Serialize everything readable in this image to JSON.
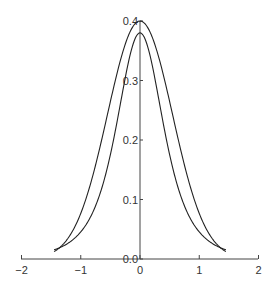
{
  "chart_data": {
    "type": "line",
    "title": "",
    "xlabel": "",
    "ylabel": "",
    "xlim": [
      -2,
      2
    ],
    "ylim": [
      0,
      0.4
    ],
    "grid": false,
    "legend": null,
    "x_ticks": [
      "-2",
      "-1",
      "0",
      "1",
      "2"
    ],
    "y_ticks": [
      "0.0",
      "0.1",
      "0.2",
      "0.3",
      "0.4"
    ],
    "x": [
      -1.45,
      -1.2,
      -1.0,
      -0.8,
      -0.6,
      -0.4,
      -0.2,
      0.0,
      0.2,
      0.4,
      0.6,
      0.8,
      1.0,
      1.2,
      1.45
    ],
    "series": [
      {
        "name": "curve-a (narrow peak)",
        "values": [
          0.012,
          0.037,
          0.076,
          0.139,
          0.219,
          0.304,
          0.374,
          0.4,
          0.374,
          0.304,
          0.219,
          0.139,
          0.076,
          0.037,
          0.012
        ]
      },
      {
        "name": "curve-b (heavier tails)",
        "values": [
          0.025,
          0.045,
          0.076,
          0.128,
          0.2,
          0.282,
          0.352,
          0.38,
          0.352,
          0.282,
          0.2,
          0.128,
          0.076,
          0.045,
          0.025
        ]
      }
    ]
  }
}
